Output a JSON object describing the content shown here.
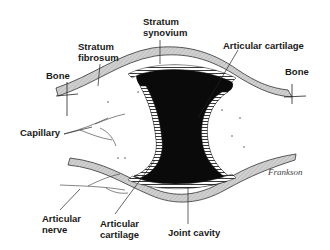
{
  "labels": {
    "stratum_synovium": "Stratum\nsynovium",
    "stratum_fibrosum": "Stratum\nfibrosum",
    "articular_cartilage_top": "Articular cartilage",
    "bone_left": "Bone",
    "bone_right": "Bone",
    "capillary": "Capillary",
    "articular_nerve": "Articular\nnerve",
    "articular_cartilage_bottom": "Articular\ncartilage",
    "joint_cavity": "Joint cavity"
  },
  "signature": "Frankson",
  "colors": {
    "capsule": "#c8c8c8",
    "cavity": "#0a0a0a",
    "ink": "#1a1a1a"
  }
}
